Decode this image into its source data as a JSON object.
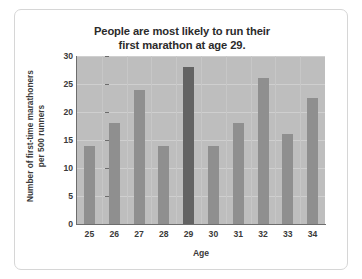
{
  "chart_data": {
    "type": "bar",
    "title": "People are most likely to run their first marathon at age 29.",
    "title_lines": [
      "People are most likely to run their",
      "first marathon at age 29."
    ],
    "xlabel": "Age",
    "ylabel": "Number of first-time marathoners per 500 runners",
    "ylabel_lines": [
      "Number of first-time marathoners",
      "per 500 runners"
    ],
    "categories": [
      "25",
      "26",
      "27",
      "28",
      "29",
      "30",
      "31",
      "32",
      "33",
      "34"
    ],
    "values": [
      14,
      18,
      24,
      14,
      28,
      14,
      18,
      26,
      16,
      22.5
    ],
    "highlight_category": "29",
    "ylim": [
      0,
      30
    ],
    "yticks": [
      0,
      5,
      10,
      15,
      20,
      25,
      30
    ],
    "ytick_labels": [
      "0",
      "5",
      "10",
      "15",
      "20",
      "25",
      "30"
    ],
    "grid": true,
    "legend": false,
    "colors": {
      "bar": "#8f8f8f",
      "bar_highlight": "#636363",
      "plot_background": "#bebebe",
      "gridline": "#cfcfcf",
      "axis": "#6d6d6d",
      "text": "#3a3a3a",
      "title_text": "#2b2b2b",
      "card_background": "#ffffff",
      "card_border": "#d6d6d6"
    }
  }
}
